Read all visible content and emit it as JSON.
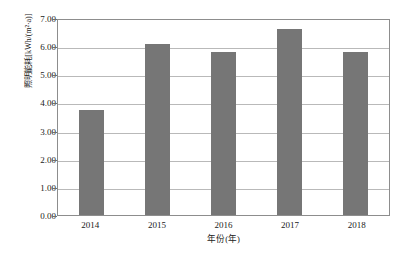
{
  "chart_data": {
    "type": "bar",
    "title": "",
    "subtitle": "",
    "xlabel": "年份(年)",
    "ylabel": "照明能耗[kWh/(m²·a)]",
    "categories": [
      "2014",
      "2015",
      "2016",
      "2017",
      "2018"
    ],
    "values": [
      3.72,
      6.08,
      5.8,
      6.6,
      5.78
    ],
    "series": [
      {
        "name": "照明能耗",
        "values": [
          3.72,
          6.08,
          5.8,
          6.6,
          5.78
        ]
      }
    ],
    "ylim": [
      0.0,
      7.0
    ],
    "ytick_step": 1.0,
    "ytick_labels": [
      "7.00",
      "6.00",
      "5.00",
      "4.00",
      "3.00",
      "2.00",
      "1.00",
      "0.00"
    ],
    "ytick_values": [
      7.0,
      6.0,
      5.0,
      4.0,
      3.0,
      2.0,
      1.0,
      0.0
    ],
    "xtick_labels": [
      "2014",
      "2015",
      "2016",
      "2017",
      "2018"
    ],
    "grid": "horizontal",
    "legend": "none",
    "legend_position": "",
    "annotations": [],
    "colors": {
      "bar": "#767676",
      "gridline": "#b9b9b9",
      "frame": "#8d8d8d",
      "background": "#ffffff",
      "text": "#1a1a1a"
    }
  }
}
